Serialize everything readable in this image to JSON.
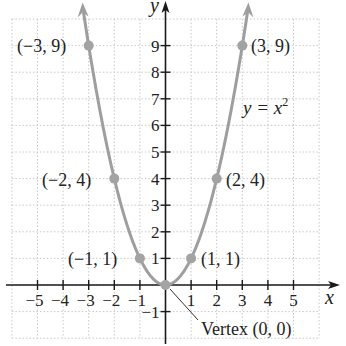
{
  "chart_data": {
    "type": "line",
    "title": "",
    "equation_label": "y = x²",
    "equation_parts": {
      "lhs": "y = x",
      "exp": "2"
    },
    "xlabel": "x",
    "ylabel": "y",
    "xlim": [
      -6,
      6
    ],
    "ylim": [
      -2,
      10
    ],
    "grid": true,
    "x_ticks": [
      -5,
      -4,
      -3,
      -2,
      -1,
      1,
      2,
      3,
      4,
      5
    ],
    "x_tick_labels": [
      "−5",
      "−4",
      "−3",
      "−2",
      "−1",
      "1",
      "2",
      "3",
      "4",
      "5"
    ],
    "y_ticks": [
      1,
      2,
      3,
      4,
      5,
      6,
      7,
      8,
      9,
      -1
    ],
    "y_tick_labels": [
      "1",
      "2",
      "3",
      "4",
      "5",
      "6",
      "7",
      "8",
      "9",
      "−1"
    ],
    "series": [
      {
        "name": "y = x^2",
        "function": "x^2",
        "domain": [
          -3.2,
          3.2
        ],
        "color": "#9e9e9e"
      }
    ],
    "points": [
      {
        "x": -3,
        "y": 9,
        "label": "(−3, 9)"
      },
      {
        "x": -2,
        "y": 4,
        "label": "(−2, 4)"
      },
      {
        "x": -1,
        "y": 1,
        "label": "(−1, 1)"
      },
      {
        "x": 0,
        "y": 0,
        "label": ""
      },
      {
        "x": 1,
        "y": 1,
        "label": "(1, 1)"
      },
      {
        "x": 2,
        "y": 4,
        "label": "(2, 4)"
      },
      {
        "x": 3,
        "y": 9,
        "label": "(3, 9)"
      }
    ],
    "annotations": [
      {
        "text": "Vertex (0, 0)",
        "points_to": [
          0,
          0
        ]
      }
    ]
  },
  "labels": {
    "x_axis": "x",
    "y_axis": "y",
    "vertex": "Vertex (0, 0)",
    "eq_lhs": "y = x",
    "eq_exp": "2",
    "p_m3": "(−3, 9)",
    "p_m2": "(−2, 4)",
    "p_m1": "(−1, 1)",
    "p_1": "(1, 1)",
    "p_2": "(2, 4)",
    "p_3": "(3, 9)"
  },
  "colors": {
    "curve": "#9e9e9e",
    "axis": "#1a1a1a",
    "grid": "#c8c8c8",
    "point": "#a3a3a3"
  }
}
